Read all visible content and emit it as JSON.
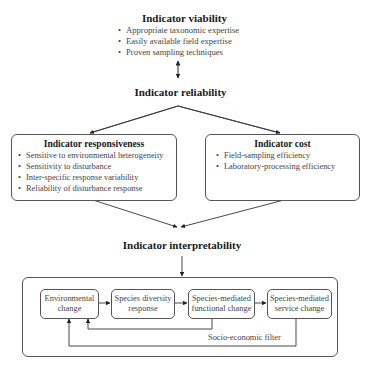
{
  "diagram": {
    "viability": {
      "title": "Indicator viability",
      "items": [
        "Appropriate taxonomic expertise",
        "Easily available field expertise",
        "Proven sampling techniques"
      ]
    },
    "reliability": {
      "title": "Indicator reliability"
    },
    "responsiveness": {
      "title": "Indicator responsiveness",
      "items": [
        "Sensitive to environmental heterogeneity",
        "Sensitivity to disturbance",
        "Inter-specific response variability",
        "Reliability of disturbance response"
      ]
    },
    "cost": {
      "title": "Indicator cost",
      "items": [
        "Field-sampling efficiency",
        "Laboratory-processing efficiency"
      ]
    },
    "interpretability": {
      "title": "Indicator interpretability",
      "nodes": [
        {
          "line1": "Environmental",
          "line2": "change"
        },
        {
          "line1": "Species diversity",
          "line2": "response"
        },
        {
          "line1": "Species-mediated",
          "line2": "functional change"
        },
        {
          "line1": "Species-mediated",
          "line2": "service change"
        }
      ],
      "feedback_label": "Socio-economic filter"
    },
    "colors": {
      "line": "#333333",
      "box_border": "#555555",
      "text": "#444444",
      "heading": "#1a1a1a"
    }
  }
}
